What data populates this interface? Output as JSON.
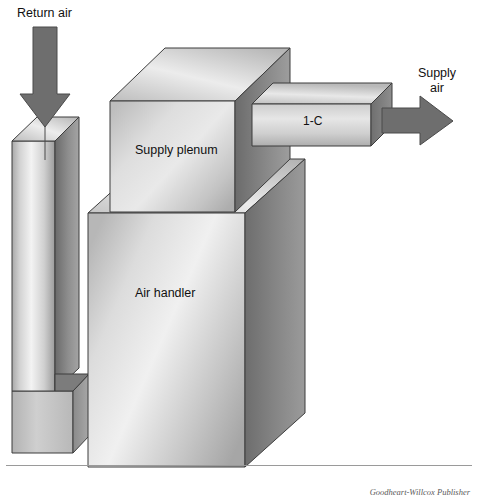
{
  "figure": {
    "background_color": "#ffffff",
    "width": 478,
    "height": 503
  },
  "labels": {
    "return_air": "Return air",
    "supply_air": "Supply\nair",
    "supply_air_line1": "Supply",
    "supply_air_line2": "air",
    "supply_plenum": "Supply plenum",
    "branch_duct": "1-C",
    "air_handler": "Air handler"
  },
  "credit": {
    "text": "Goodheart-Willcox Publisher"
  },
  "arrows": {
    "return_air": {
      "name": "return-air-arrow",
      "direction": "down",
      "color": "#6e6e6e"
    },
    "supply_air": {
      "name": "supply-air-arrow",
      "direction": "right",
      "color": "#6e6e6e"
    }
  },
  "components": [
    {
      "id": "return-duct",
      "label": "Return air duct",
      "shape": "vertical rectangular duct",
      "faces": [
        "top",
        "front",
        "right-side"
      ]
    },
    {
      "id": "return-duct-base",
      "label": "Return duct base",
      "shape": "rectangular base block",
      "faces": [
        "front",
        "right-side"
      ]
    },
    {
      "id": "air-handler",
      "label": "Air handler",
      "shape": "large rectangular cabinet",
      "faces": [
        "top",
        "front",
        "right-side"
      ]
    },
    {
      "id": "supply-plenum",
      "label": "Supply plenum",
      "shape": "rectangular plenum box",
      "faces": [
        "top",
        "front",
        "right-side"
      ]
    },
    {
      "id": "branch-duct",
      "label": "1-C",
      "shape": "horizontal branch duct",
      "faces": [
        "top",
        "front",
        "right-end"
      ]
    }
  ],
  "colors": {
    "outline": "#3d3d3d",
    "arrow_fill": "#6e6e6e",
    "arrow_outline": "#4a4a4a",
    "face_light": "#f2f2f2",
    "face_mid": "#c9c9c9",
    "face_dark": "#8f8f8f",
    "face_darker": "#6f6f6f",
    "text": "#111111",
    "credit_text": "#5a5a5a",
    "rule": "#9a9a9a"
  }
}
